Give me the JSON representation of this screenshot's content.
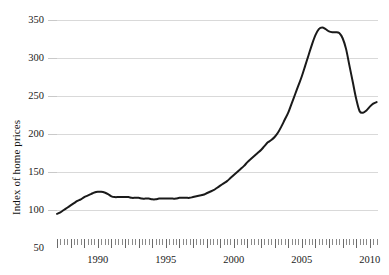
{
  "chart_data": {
    "type": "line",
    "title": "",
    "subtitle": "",
    "xlabel": "",
    "ylabel": "Index of home prices",
    "xlim": [
      1987.0,
      2010.6
    ],
    "ylim": [
      50,
      350
    ],
    "grid": true,
    "legend": null,
    "legend_position": "none",
    "y_ticks": [
      50,
      100,
      150,
      200,
      250,
      300,
      350
    ],
    "y_tick_labels": [
      "50",
      "100",
      "150",
      "200",
      "250",
      "300",
      "350"
    ],
    "x_ticks": [
      1990,
      1995,
      2000,
      2005,
      2010
    ],
    "x_tick_labels": [
      "1990",
      "1995",
      "2000",
      "2005",
      "2010"
    ],
    "x_minor_tick_interval": 0.25,
    "x_minor_tick_start": 1987.0,
    "x_minor_tick_end": 2010.5,
    "line_color": "#1a1a1a",
    "line_width": 2.0,
    "grid_color": "#d9d9d9",
    "axis_text_color": "#1a1a1a",
    "background_color": "#ffffff",
    "series": [
      {
        "name": "Index of home prices",
        "x": [
          1987.0,
          1987.25,
          1987.5,
          1987.75,
          1988.0,
          1988.25,
          1988.5,
          1988.75,
          1989.0,
          1989.25,
          1989.5,
          1989.75,
          1990.0,
          1990.25,
          1990.5,
          1990.75,
          1991.0,
          1991.25,
          1991.5,
          1991.75,
          1992.0,
          1992.25,
          1992.5,
          1992.75,
          1993.0,
          1993.25,
          1993.5,
          1993.75,
          1994.0,
          1994.25,
          1994.5,
          1994.75,
          1995.0,
          1995.25,
          1995.5,
          1995.75,
          1996.0,
          1996.25,
          1996.5,
          1996.75,
          1997.0,
          1997.25,
          1997.5,
          1997.75,
          1998.0,
          1998.25,
          1998.5,
          1998.75,
          1999.0,
          1999.25,
          1999.5,
          1999.75,
          2000.0,
          2000.25,
          2000.5,
          2000.75,
          2001.0,
          2001.25,
          2001.5,
          2001.75,
          2002.0,
          2002.25,
          2002.5,
          2002.75,
          2003.0,
          2003.25,
          2003.5,
          2003.75,
          2004.0,
          2004.25,
          2004.5,
          2004.75,
          2005.0,
          2005.25,
          2005.5,
          2005.75,
          2006.0,
          2006.25,
          2006.5,
          2006.75,
          2007.0,
          2007.25,
          2007.5,
          2007.75,
          2008.0,
          2008.25,
          2008.5,
          2008.75,
          2009.0,
          2009.25,
          2009.5,
          2009.75,
          2010.0,
          2010.25,
          2010.5
        ],
        "y": [
          95,
          97,
          100,
          103,
          106,
          109,
          112,
          114,
          117,
          119,
          121,
          123,
          124,
          124,
          123,
          121,
          118,
          117,
          117,
          117,
          117,
          117,
          116,
          116,
          116,
          115,
          115,
          115,
          114,
          114,
          115,
          115,
          115,
          115,
          115,
          115,
          116,
          116,
          116,
          116,
          117,
          118,
          119,
          120,
          122,
          124,
          126,
          129,
          132,
          135,
          138,
          142,
          146,
          150,
          154,
          158,
          163,
          167,
          171,
          175,
          179,
          184,
          189,
          192,
          196,
          202,
          210,
          219,
          228,
          240,
          252,
          264,
          276,
          290,
          304,
          318,
          330,
          338,
          340,
          338,
          335,
          334,
          334,
          333,
          326,
          312,
          290,
          268,
          246,
          230,
          228,
          231,
          236,
          240,
          242
        ]
      }
    ],
    "annotations": []
  }
}
